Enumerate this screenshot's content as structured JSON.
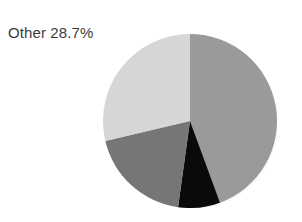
{
  "figure": {
    "background_color": "#ffffff",
    "width": 302,
    "height": 222
  },
  "annotations": [
    {
      "name": "other-label",
      "text": "Other 28.7%",
      "color": "#3c3c3c"
    }
  ],
  "chart_data": {
    "type": "pie",
    "title": "",
    "xlabel": "",
    "ylabel": "",
    "legend": "none",
    "grid": false,
    "start_angle_deg": 0,
    "direction": "clockwise",
    "center": [
      190,
      121
    ],
    "radius": 87,
    "labels": [
      "Segment 1",
      "Segment 2",
      "Segment 3",
      "Other"
    ],
    "values": [
      44.4,
      7.8,
      19.1,
      28.7
    ],
    "colors": [
      "#9a9a9a",
      "#0a0a0a",
      "#767676",
      "#d6d6d6"
    ],
    "slices": [
      {
        "label": "Segment 1",
        "value": 44.4,
        "color": "#9a9a9a",
        "start_deg": 0,
        "end_deg": 159.8,
        "data_label": ""
      },
      {
        "label": "Segment 2",
        "value": 7.8,
        "color": "#0a0a0a",
        "start_deg": 159.8,
        "end_deg": 187.9,
        "data_label": ""
      },
      {
        "label": "Segment 3",
        "value": 19.1,
        "color": "#767676",
        "start_deg": 187.9,
        "end_deg": 256.7,
        "data_label": ""
      },
      {
        "label": "Other",
        "value": 28.7,
        "color": "#d6d6d6",
        "start_deg": 256.7,
        "end_deg": 360,
        "data_label": "Other 28.7%"
      }
    ]
  }
}
